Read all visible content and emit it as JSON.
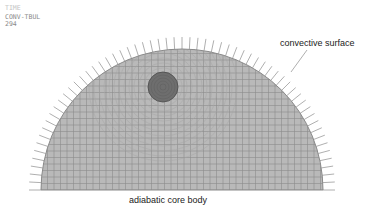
{
  "header": {
    "line1": "TIME",
    "line2": "CONV-TBUL",
    "line3": "294"
  },
  "labels": {
    "convective": "convective surface",
    "adiabatic": "adiabatic core body"
  },
  "geometry": {
    "center_x": 182,
    "base_y": 190,
    "mesh_radius": 141,
    "arrow_length": 12,
    "arrow_count": 60,
    "inclusion": {
      "cx": 163,
      "cy": 87,
      "r": 15
    }
  },
  "colors": {
    "mesh_fill": "#b9b9b9",
    "mesh_lines": "#8c8c8c",
    "inclusion_fill": "#6e6e6e",
    "arrows": "#9a9a9a"
  }
}
